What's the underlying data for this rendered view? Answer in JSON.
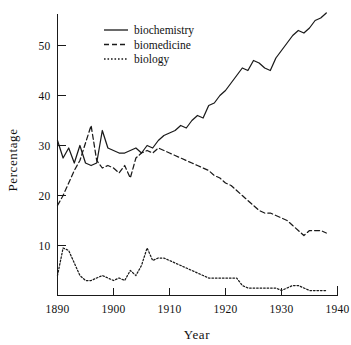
{
  "chart_data": {
    "type": "line",
    "title": "",
    "xlabel": "Year",
    "ylabel": "Percentage",
    "xlim": [
      1890,
      1940
    ],
    "ylim": [
      0,
      57
    ],
    "grid": false,
    "legend_position": "top-center",
    "xticks": [
      1890,
      1900,
      1910,
      1920,
      1930,
      1940
    ],
    "xtick_labels": [
      "1890",
      "1900",
      "1910",
      "1920",
      "1930",
      "1940"
    ],
    "yticks": [
      10,
      20,
      30,
      40,
      50
    ],
    "ytick_labels": [
      "10",
      "20",
      "30",
      "40",
      "50"
    ],
    "x": [
      1890,
      1891,
      1892,
      1893,
      1894,
      1895,
      1896,
      1897,
      1898,
      1899,
      1900,
      1901,
      1902,
      1903,
      1904,
      1905,
      1906,
      1907,
      1908,
      1909,
      1910,
      1911,
      1912,
      1913,
      1914,
      1915,
      1916,
      1917,
      1918,
      1919,
      1920,
      1921,
      1922,
      1923,
      1924,
      1925,
      1926,
      1927,
      1928,
      1929,
      1930,
      1931,
      1932,
      1933,
      1934,
      1935,
      1936,
      1937,
      1938
    ],
    "series": [
      {
        "name": "biochemistry",
        "style": "solid",
        "values": [
          31.0,
          27.5,
          29.5,
          26.5,
          30.0,
          26.5,
          26.0,
          26.5,
          33.0,
          29.5,
          29.0,
          28.5,
          28.5,
          29.0,
          29.5,
          28.5,
          30.0,
          29.5,
          31.0,
          32.0,
          32.5,
          33.0,
          34.0,
          33.5,
          35.0,
          36.0,
          35.5,
          38.0,
          38.5,
          40.0,
          41.0,
          42.5,
          44.0,
          45.5,
          45.0,
          47.0,
          46.5,
          45.5,
          45.0,
          47.5,
          49.0,
          50.5,
          52.0,
          53.0,
          52.5,
          53.5,
          55.0,
          55.5,
          56.5
        ]
      },
      {
        "name": "biomedicine",
        "style": "dashed",
        "values": [
          18.0,
          20.0,
          22.5,
          25.0,
          27.0,
          30.5,
          34.0,
          27.0,
          25.5,
          26.0,
          25.5,
          24.5,
          26.0,
          23.5,
          27.5,
          28.5,
          29.0,
          28.5,
          29.5,
          29.0,
          28.5,
          28.0,
          27.5,
          27.0,
          26.5,
          26.0,
          25.5,
          25.0,
          24.0,
          23.5,
          22.5,
          22.0,
          21.0,
          20.0,
          19.0,
          18.0,
          17.0,
          16.5,
          16.5,
          16.0,
          15.5,
          15.0,
          14.0,
          13.0,
          12.0,
          13.0,
          13.0,
          13.0,
          12.5
        ]
      },
      {
        "name": "biology",
        "style": "dotted",
        "values": [
          4.0,
          9.5,
          9.0,
          6.5,
          4.0,
          3.0,
          3.0,
          3.5,
          4.0,
          3.5,
          3.0,
          3.5,
          3.0,
          5.0,
          4.0,
          6.0,
          9.5,
          7.0,
          7.5,
          7.5,
          7.0,
          6.5,
          6.0,
          5.5,
          5.0,
          4.5,
          4.0,
          3.5,
          3.5,
          3.5,
          3.5,
          3.5,
          3.5,
          2.0,
          1.5,
          1.5,
          1.5,
          1.5,
          1.5,
          1.5,
          1.0,
          1.5,
          2.0,
          2.0,
          1.5,
          1.0,
          1.0,
          1.0,
          1.0
        ]
      }
    ],
    "legend": [
      {
        "label": "biochemistry",
        "style": "solid"
      },
      {
        "label": "biomedicine",
        "style": "dashed"
      },
      {
        "label": "biology",
        "style": "dotted"
      }
    ]
  },
  "colors": {
    "ink": "#1a1a1a",
    "background": "#ffffff"
  }
}
